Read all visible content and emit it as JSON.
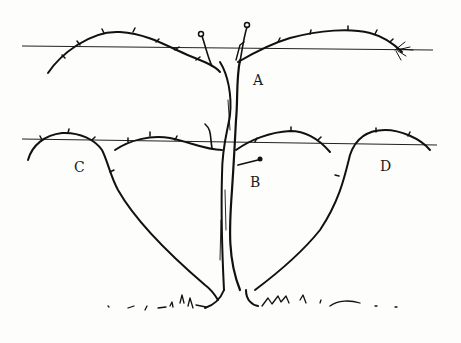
{
  "figure": {
    "labels": [
      {
        "id": "A",
        "text": "A",
        "x": 253,
        "y": 74
      },
      {
        "id": "B",
        "text": "B",
        "x": 250,
        "y": 176
      },
      {
        "id": "C",
        "text": "C",
        "x": 74,
        "y": 161
      },
      {
        "id": "D",
        "text": "D",
        "x": 380,
        "y": 160
      }
    ],
    "wires": [
      {
        "name": "upper-wire",
        "y": 47,
        "x1": 22,
        "x2": 433
      },
      {
        "name": "lower-wire",
        "y": 142,
        "x1": 22,
        "x2": 437
      }
    ],
    "colors": {
      "ink": "#111111",
      "paper": "#fdfdfc"
    }
  }
}
